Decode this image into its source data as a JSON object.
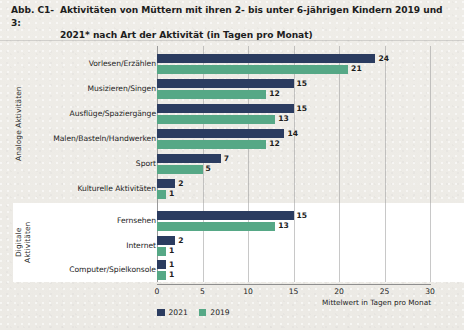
{
  "figure": {
    "number": "Abb. C1-3:",
    "title_line1": "Aktivitäten von Müttern mit ihren 2- bis unter 6-jährigen Kindern 2019 und",
    "title_line2": "2021* nach Art der Aktivität (in Tagen pro Monat)"
  },
  "groups": {
    "analog_label": "Analoge Aktivitäten",
    "digital_label": "Digitale Aktivitäten"
  },
  "axis": {
    "x_title": "Mittelwert in Tagen pro Monat",
    "ticks": [
      "0",
      "5",
      "10",
      "15",
      "20",
      "25",
      "30"
    ]
  },
  "legend": {
    "items": [
      {
        "label": "2021",
        "color": "#2b3c60"
      },
      {
        "label": "2019",
        "color": "#56a886"
      }
    ]
  },
  "chart_data": {
    "type": "bar",
    "orientation": "horizontal",
    "title": "Abb. C1-3: Aktivitäten von Müttern mit ihren 2- bis unter 6-jährigen Kindern 2019 und 2021* nach Art der Aktivität (in Tagen pro Monat)",
    "xlabel": "Mittelwert in Tagen pro Monat",
    "ylabel": "",
    "xlim": [
      0,
      30
    ],
    "xticks": [
      0,
      5,
      10,
      15,
      20,
      25,
      30
    ],
    "grid": "vertical",
    "legend_position": "bottom-left",
    "groups": [
      {
        "name": "Analoge Aktivitäten",
        "categories": [
          "Vorlesen/Erzählen",
          "Musizieren/Singen",
          "Ausflüge/Spaziergänge",
          "Malen/Basteln/Handwerken",
          "Sport",
          "Kulturelle Aktivitäten"
        ]
      },
      {
        "name": "Digitale Aktivitäten",
        "categories": [
          "Fernsehen",
          "Internet",
          "Computer/Spielkonsole"
        ]
      }
    ],
    "categories": [
      "Vorlesen/Erzählen",
      "Musizieren/Singen",
      "Ausflüge/Spaziergänge",
      "Malen/Basteln/Handwerken",
      "Sport",
      "Kulturelle Aktivitäten",
      "Fernsehen",
      "Internet",
      "Computer/Spielkonsole"
    ],
    "series": [
      {
        "name": "2021",
        "color": "#2b3c60",
        "values": [
          24,
          15,
          15,
          14,
          7,
          2,
          15,
          2,
          1
        ]
      },
      {
        "name": "2019",
        "color": "#56a886",
        "values": [
          21,
          12,
          13,
          12,
          5,
          1,
          13,
          1,
          1
        ]
      }
    ]
  },
  "rows": [
    {
      "label": "Vorlesen/Erzählen",
      "v2021": 24,
      "v2019": 21,
      "group": "analog"
    },
    {
      "label": "Musizieren/Singen",
      "v2021": 15,
      "v2019": 12,
      "group": "analog"
    },
    {
      "label": "Ausflüge/Spaziergänge",
      "v2021": 15,
      "v2019": 13,
      "group": "analog"
    },
    {
      "label": "Malen/Basteln/Handwerken",
      "v2021": 14,
      "v2019": 12,
      "group": "analog"
    },
    {
      "label": "Sport",
      "v2021": 7,
      "v2019": 5,
      "group": "analog"
    },
    {
      "label": "Kulturelle Aktivitäten",
      "v2021": 2,
      "v2019": 1,
      "group": "analog"
    },
    {
      "label": "Fernsehen",
      "v2021": 15,
      "v2019": 13,
      "group": "digital"
    },
    {
      "label": "Internet",
      "v2021": 2,
      "v2019": 1,
      "group": "digital"
    },
    {
      "label": "Computer/Spielkonsole",
      "v2021": 1,
      "v2019": 1,
      "group": "digital"
    }
  ]
}
